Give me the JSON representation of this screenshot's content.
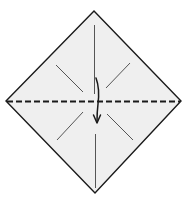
{
  "diagram": {
    "type": "origami-step",
    "paper": {
      "shape": "diamond",
      "fill_color": "#efefef",
      "outline_color": "#1a1a1a"
    },
    "folds": [
      {
        "kind": "valley-fold",
        "orientation": "horizontal",
        "style": "dashed"
      }
    ],
    "creases": [
      {
        "kind": "pre-crease",
        "orientation": "vertical",
        "region": "top"
      },
      {
        "kind": "pre-crease",
        "orientation": "vertical",
        "region": "bottom"
      },
      {
        "kind": "pre-crease",
        "orientation": "diagonal",
        "region": "upper-left"
      },
      {
        "kind": "pre-crease",
        "orientation": "diagonal",
        "region": "upper-right"
      },
      {
        "kind": "pre-crease",
        "orientation": "diagonal",
        "region": "lower-left"
      },
      {
        "kind": "pre-crease",
        "orientation": "diagonal",
        "region": "lower-right"
      }
    ],
    "arrows": [
      {
        "kind": "fold-arrow",
        "direction": "down"
      }
    ],
    "colors": {
      "line": "#1a1a1a",
      "crease": "#555555"
    }
  }
}
